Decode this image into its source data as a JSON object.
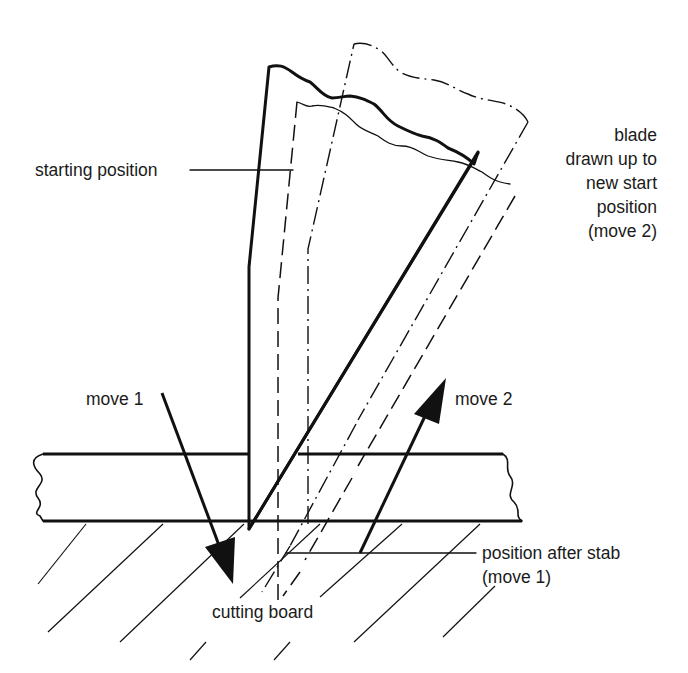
{
  "diagram": {
    "type": "technical illustration",
    "labels": {
      "starting_position": "starting position",
      "blade_line1": "blade",
      "blade_line2": "drawn up to",
      "blade_line3": "new start",
      "blade_line4": "position",
      "blade_line5": "(move 2)",
      "move1": "move 1",
      "move2": "move 2",
      "after_stab_line1": "position after stab",
      "after_stab_line2": "(move 1)",
      "cutting_board": "cutting board"
    },
    "elements": [
      {
        "name": "blade-starting-position",
        "style": "solid thick"
      },
      {
        "name": "blade-after-stab",
        "style": "dashed"
      },
      {
        "name": "blade-new-start",
        "style": "dash-dot"
      },
      {
        "name": "food-slab",
        "style": "solid, wavy ends"
      },
      {
        "name": "cutting-board",
        "style": "diagonal hatching"
      },
      {
        "name": "move1-arrow",
        "direction": "down"
      },
      {
        "name": "move2-arrow",
        "direction": "up"
      }
    ],
    "colors": {
      "ink": "#111111",
      "background": "#ffffff"
    }
  }
}
